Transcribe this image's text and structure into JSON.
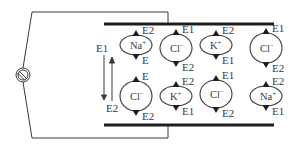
{
  "diagram": {
    "type": "electrophoresis-ion-oscillation",
    "source": {
      "symbol": "ac-source",
      "cx": 23,
      "cy": 75,
      "r": 7
    },
    "wires": {
      "top": {
        "y": 12,
        "x_left": 32,
        "x_right": 168,
        "drop_to": 24
      },
      "bottom": {
        "y": 138,
        "x_left": 32,
        "x_right": 168,
        "rise_to": 125
      }
    },
    "plates": {
      "top": {
        "x1": 104,
        "x2": 274,
        "y": 24
      },
      "bottom": {
        "x1": 104,
        "x2": 274,
        "y": 125
      }
    },
    "field_arrows": {
      "down_label": "E1",
      "up_label": "E2"
    },
    "ions": [
      {
        "name": "Na",
        "charge": "+",
        "cx": 136,
        "cy": 45,
        "rx": 16,
        "ry": 10,
        "top_label": "E2",
        "bottom_label": "E"
      },
      {
        "name": "Cl",
        "charge": "−",
        "cx": 176,
        "cy": 48,
        "rx": 16,
        "ry": 14,
        "top_label": "E1",
        "bottom_label": "E2"
      },
      {
        "name": "K",
        "charge": "+",
        "cx": 216,
        "cy": 45,
        "rx": 16,
        "ry": 10,
        "top_label": "E2",
        "bottom_label": "E1"
      },
      {
        "name": "Cl",
        "charge": "−",
        "cx": 266,
        "cy": 48,
        "rx": 16,
        "ry": 15,
        "top_label": "E1",
        "bottom_label": "E2"
      },
      {
        "name": "Cl",
        "charge": "−",
        "cx": 136,
        "cy": 96,
        "rx": 16,
        "ry": 15,
        "top_label": "E",
        "bottom_label": "E2"
      },
      {
        "name": "K",
        "charge": "+",
        "cx": 176,
        "cy": 96,
        "rx": 16,
        "ry": 10,
        "top_label": "E2",
        "bottom_label": "E1"
      },
      {
        "name": "Cl",
        "charge": "−",
        "cx": 216,
        "cy": 94,
        "rx": 16,
        "ry": 14,
        "top_label": "E1",
        "bottom_label": "E2"
      },
      {
        "name": "Na",
        "charge": "+",
        "cx": 266,
        "cy": 96,
        "rx": 16,
        "ry": 10,
        "top_label": "E2",
        "bottom_label": "E1"
      }
    ],
    "colors": {
      "line": "#3a3a3a",
      "plate": "#1e1e1e",
      "text": "#3a3a3a",
      "background": "#ffffff"
    }
  }
}
